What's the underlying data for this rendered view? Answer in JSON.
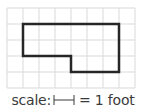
{
  "figure": {
    "grid": {
      "columns": 8,
      "rows": 5,
      "cell_size_px": 16,
      "origin_px": [
        7,
        8
      ],
      "line_color": "#d9d9d9"
    },
    "shape": {
      "stroke_color": "#262626",
      "vertices_grid": [
        [
          1,
          1
        ],
        [
          7,
          1
        ],
        [
          7,
          4
        ],
        [
          4,
          4
        ],
        [
          4,
          3
        ],
        [
          1,
          3
        ]
      ]
    }
  },
  "scale": {
    "prefix": "scale:",
    "suffix": "= 1 foot",
    "bar_units": 1
  }
}
